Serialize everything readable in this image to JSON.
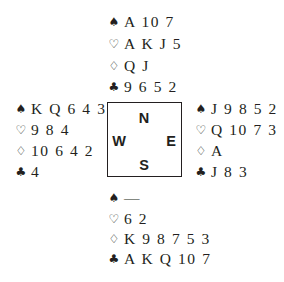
{
  "suits": {
    "spades": "♠",
    "hearts": "♡",
    "diamonds": "♢",
    "clubs": "♣"
  },
  "compass": {
    "north": "N",
    "south": "S",
    "east": "E",
    "west": "W"
  },
  "hands": {
    "north": {
      "spades": "A 10 7",
      "hearts": "A K J 5",
      "diamonds": "Q J",
      "clubs": "9 6 5 2"
    },
    "west": {
      "spades": "K Q 6 4 3",
      "hearts": "9 8 4",
      "diamonds": "10 6 4 2",
      "clubs": "4"
    },
    "east": {
      "spades": "J 9 8 5 2",
      "hearts": "Q 10 7 3",
      "diamonds": "A",
      "clubs": "J 8 3"
    },
    "south": {
      "spades": "—",
      "hearts": "6 2",
      "diamonds": "K 9 8 7 5 3",
      "clubs": "A K Q 10 7"
    }
  }
}
